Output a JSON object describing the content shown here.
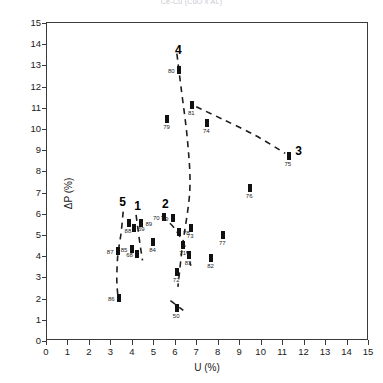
{
  "figure": {
    "title": "Ce-Cu (CuO x AL)",
    "x_axis_title": "U (%)",
    "y_axis_title": "ΔP (%)"
  },
  "chart_data": {
    "type": "scatter",
    "title": "Ce-Cu (CuO x AL)",
    "xlabel": "U (%)",
    "ylabel": "ΔP (%)",
    "xlim": [
      0,
      15
    ],
    "ylim": [
      0,
      15
    ],
    "xticks": [
      0,
      1,
      2,
      3,
      4,
      5,
      6,
      7,
      8,
      9,
      10,
      11,
      12,
      13,
      14,
      15
    ],
    "yticks": [
      0,
      1,
      2,
      3,
      4,
      5,
      6,
      7,
      8,
      9,
      10,
      11,
      12,
      13,
      14,
      15
    ],
    "grid": false,
    "legend": "none",
    "marker": "small filled vertical bar",
    "points": [
      {
        "label": "50",
        "x": 6.05,
        "y": 1.55,
        "label_pos": "below"
      },
      {
        "label": "70",
        "x": 5.45,
        "y": 5.85,
        "label_pos": "left"
      },
      {
        "label": "71",
        "x": 6.35,
        "y": 4.55,
        "label_pos": "below"
      },
      {
        "label": "72",
        "x": 6.05,
        "y": 3.25,
        "label_pos": "below"
      },
      {
        "label": "73",
        "x": 6.7,
        "y": 5.35,
        "label_pos": "below"
      },
      {
        "label": "74",
        "x": 7.45,
        "y": 10.3,
        "label_pos": "below"
      },
      {
        "label": "75",
        "x": 11.25,
        "y": 8.75,
        "label_pos": "below"
      },
      {
        "label": "76",
        "x": 9.45,
        "y": 7.2,
        "label_pos": "below"
      },
      {
        "label": "77",
        "x": 8.2,
        "y": 5.0,
        "label_pos": "below"
      },
      {
        "label": "78",
        "x": 6.15,
        "y": 5.15,
        "label_pos": "right"
      },
      {
        "label": "79",
        "x": 5.6,
        "y": 10.45,
        "label_pos": "below"
      },
      {
        "label": "80",
        "x": 6.15,
        "y": 12.8,
        "label_pos": "left"
      },
      {
        "label": "81",
        "x": 6.75,
        "y": 11.15,
        "label_pos": "below"
      },
      {
        "label": "82",
        "x": 7.65,
        "y": 3.9,
        "label_pos": "below"
      },
      {
        "label": "83",
        "x": 6.6,
        "y": 4.05,
        "label_pos": "below"
      },
      {
        "label": "84",
        "x": 4.95,
        "y": 4.65,
        "label_pos": "below"
      },
      {
        "label": "85",
        "x": 3.95,
        "y": 4.35,
        "label_pos": "left"
      },
      {
        "label": "86",
        "x": 3.35,
        "y": 2.05,
        "label_pos": "left"
      },
      {
        "label": "87",
        "x": 3.3,
        "y": 4.25,
        "label_pos": "left"
      },
      {
        "label": "88",
        "x": 3.8,
        "y": 5.55,
        "label_pos": "below"
      },
      {
        "label": "89",
        "x": 4.4,
        "y": 5.55,
        "label_pos": "right"
      },
      {
        "label": "90",
        "x": 5.85,
        "y": 5.8,
        "label_pos": "left"
      },
      {
        "label": "69",
        "x": 4.05,
        "y": 5.35,
        "label_pos": "right"
      },
      {
        "label": "68",
        "x": 4.2,
        "y": 4.1,
        "label_pos": "left"
      }
    ],
    "group_labels": [
      {
        "text": "1",
        "x": 4.2,
        "y": 6.35
      },
      {
        "text": "2",
        "x": 5.5,
        "y": 6.45
      },
      {
        "text": "3",
        "x": 11.7,
        "y": 8.95
      },
      {
        "text": "4",
        "x": 6.1,
        "y": 13.75
      },
      {
        "text": "5",
        "x": 3.5,
        "y": 6.55
      }
    ],
    "trend_curves": [
      {
        "name": "curve-4",
        "points": [
          [
            6.05,
            13.55
          ],
          [
            6.25,
            11.9
          ],
          [
            6.55,
            9.4
          ],
          [
            6.65,
            7.1
          ],
          [
            6.3,
            4.4
          ],
          [
            6.1,
            2.55
          ]
        ]
      },
      {
        "name": "curve-3",
        "points": [
          [
            6.95,
            11.05
          ],
          [
            8.2,
            10.45
          ],
          [
            9.7,
            9.7
          ],
          [
            11.1,
            8.85
          ]
        ]
      },
      {
        "name": "curve-5",
        "points": [
          [
            3.55,
            6.1
          ],
          [
            3.45,
            5.1
          ],
          [
            3.3,
            4.05
          ],
          [
            3.25,
            2.9
          ],
          [
            3.3,
            2.15
          ]
        ]
      },
      {
        "name": "curve-1",
        "points": [
          [
            4.15,
            5.95
          ],
          [
            4.25,
            5.2
          ],
          [
            4.35,
            4.45
          ],
          [
            4.45,
            3.8
          ]
        ]
      },
      {
        "name": "curve-2",
        "points": [
          [
            5.35,
            5.9
          ],
          [
            5.95,
            5.3
          ],
          [
            6.45,
            4.4
          ],
          [
            6.7,
            3.55
          ]
        ]
      },
      {
        "name": "curve-50",
        "points": [
          [
            5.75,
            1.9
          ],
          [
            6.35,
            1.45
          ]
        ]
      }
    ]
  }
}
